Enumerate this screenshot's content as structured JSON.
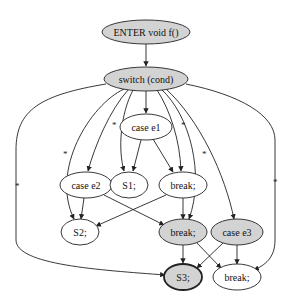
{
  "diagram": {
    "type": "control-flow-graph",
    "colors": {
      "gray_fill": "#d3d3d3",
      "white_fill": "#ffffff",
      "stroke": "#222222"
    },
    "nodes": [
      {
        "id": "enter",
        "label": "ENTER void f()",
        "fill": "gray",
        "bold": false
      },
      {
        "id": "switch",
        "label": "switch (cond)",
        "fill": "gray",
        "bold": false
      },
      {
        "id": "case_e1",
        "label": "case e1",
        "fill": "white",
        "bold": false
      },
      {
        "id": "case_e2",
        "label": "case e2",
        "fill": "white",
        "bold": false
      },
      {
        "id": "s1",
        "label": "S1;",
        "fill": "white",
        "bold": false
      },
      {
        "id": "break1",
        "label": "break;",
        "fill": "white",
        "bold": false
      },
      {
        "id": "s2",
        "label": "S2;",
        "fill": "white",
        "bold": false
      },
      {
        "id": "break2",
        "label": "break;",
        "fill": "gray",
        "bold": false
      },
      {
        "id": "case_e3",
        "label": "case e3",
        "fill": "gray",
        "bold": false
      },
      {
        "id": "s3",
        "label": "S3;",
        "fill": "gray",
        "bold": true
      },
      {
        "id": "break3",
        "label": "break;",
        "fill": "white",
        "bold": false
      }
    ],
    "edges": [
      {
        "from": "enter",
        "to": "switch",
        "label": ""
      },
      {
        "from": "switch",
        "to": "case_e1",
        "label": ""
      },
      {
        "from": "switch",
        "to": "case_e2",
        "label": "*"
      },
      {
        "from": "switch",
        "to": "s1",
        "label": "*"
      },
      {
        "from": "switch",
        "to": "break1",
        "label": ""
      },
      {
        "from": "switch",
        "to": "s2",
        "label": "*"
      },
      {
        "from": "switch",
        "to": "break2",
        "label": "*"
      },
      {
        "from": "switch",
        "to": "case_e3",
        "label": "*"
      },
      {
        "from": "switch",
        "to": "s3",
        "label": "*"
      },
      {
        "from": "switch",
        "to": "break3",
        "label": "*"
      },
      {
        "from": "case_e1",
        "to": "s1",
        "label": ""
      },
      {
        "from": "case_e1",
        "to": "break1",
        "label": ""
      },
      {
        "from": "case_e2",
        "to": "s2",
        "label": ""
      },
      {
        "from": "case_e2",
        "to": "break2",
        "label": ""
      },
      {
        "from": "break1",
        "to": "s2",
        "label": ""
      },
      {
        "from": "break1",
        "to": "break2",
        "label": ""
      },
      {
        "from": "break2",
        "to": "s3",
        "label": ""
      },
      {
        "from": "break2",
        "to": "break3",
        "label": ""
      },
      {
        "from": "case_e3",
        "to": "s3",
        "label": ""
      },
      {
        "from": "case_e3",
        "to": "break3",
        "label": ""
      }
    ],
    "edge_mark": "*"
  }
}
